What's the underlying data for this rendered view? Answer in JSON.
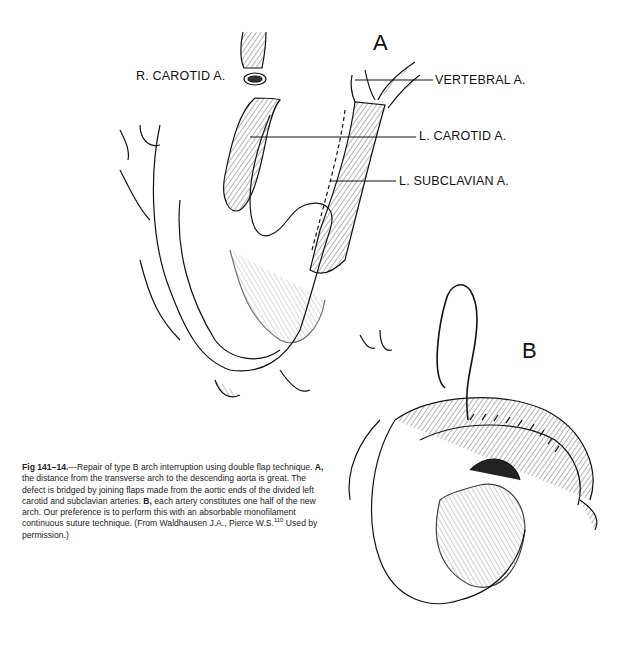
{
  "figure": {
    "panels": [
      {
        "letter": "A",
        "labels": {
          "r_carotid": "R. CAROTID A.",
          "vertebral": "VERTEBRAL A.",
          "l_carotid": "L. CAROTID A.",
          "l_subclavian": "L. SUBCLAVIAN A."
        }
      },
      {
        "letter": "B"
      }
    ],
    "caption": {
      "figure_number": "Fig 141–14.",
      "intro": "—Repair of type B arch interruption using double flap technique.",
      "part_a_label": "A,",
      "part_a_text": " the distance from the transverse arch to the descending aorta is great. The defect is bridged by joining flaps made from the aortic ends of the divided left carotid and subclavian arteries. ",
      "part_b_label": "B,",
      "part_b_text": " each artery constitutes one half of the new arch. Our preference is to perform this with an absorbable monofilament continuous suture technique. (From Waldhausen J.A., Pierce W.S.",
      "reference_superscript": "110",
      "closing": " Used by permission.)"
    }
  }
}
